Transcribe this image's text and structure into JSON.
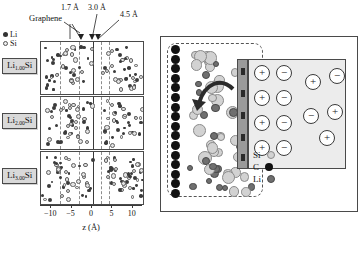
{
  "figure": {
    "left_panel": {
      "legend": [
        {
          "symbol": "li-filled-dot",
          "label": "Li"
        },
        {
          "symbol": "si-open-circle",
          "label": "Si"
        }
      ],
      "annotations": {
        "graphene": "Graphene",
        "dist_1": "1.7 Å",
        "dist_2": "3.0 Å",
        "dist_3": "4.5 Å"
      },
      "panels": [
        {
          "id": "a",
          "tag_prefix": "Li",
          "tag_sub": "1.00",
          "tag_suffix": "Si"
        },
        {
          "id": "b",
          "tag_prefix": "Li",
          "tag_sub": "2.00",
          "tag_suffix": "Si"
        },
        {
          "id": "c",
          "tag_prefix": "Li",
          "tag_sub": "3.00",
          "tag_suffix": "Si"
        }
      ],
      "axis": {
        "title": "z (Å)",
        "ticks": [
          "−10",
          "−5",
          "0",
          "5",
          "10"
        ],
        "range": [
          -12.5,
          12.5
        ]
      }
    },
    "right_panel": {
      "legend": [
        {
          "symbol": "si-sphere",
          "label": "Si",
          "color": "#d2d2d2"
        },
        {
          "symbol": "c-sphere",
          "label": "C",
          "color": "#111111"
        },
        {
          "symbol": "li-sphere",
          "label": "Li",
          "color": "#6f6f6f"
        }
      ],
      "electrolyte_ions": {
        "ordered_layer": [
          [
            "+",
            "−"
          ],
          [
            "+",
            "−"
          ],
          [
            "+",
            "−"
          ],
          [
            "+",
            "−"
          ]
        ],
        "bulk": [
          "+",
          "−",
          "−",
          "+",
          "+"
        ]
      },
      "arrow": "ion-transfer-arrow"
    }
  },
  "chart_data": {
    "type": "scatter",
    "xlabel": "z (Å)",
    "ylabel": "",
    "xlim": [
      -12.5,
      12.5
    ],
    "grid": false,
    "legend": [
      "Li",
      "Si"
    ],
    "legend_position": "top-left",
    "annotations": [
      {
        "text": "Graphene",
        "x": -1.0
      },
      {
        "text": "1.7 Å",
        "x": 0.9
      },
      {
        "text": "3.0 Å",
        "x": 2.2
      },
      {
        "text": "4.5 Å",
        "x": 4.5
      }
    ],
    "subplots": [
      {
        "label": "Li1.00Si",
        "series": [
          {
            "name": "Li",
            "color": "#3b3b3b"
          },
          {
            "name": "Si",
            "color": "#e2e2e2"
          }
        ]
      },
      {
        "label": "Li2.00Si",
        "series": [
          {
            "name": "Li",
            "color": "#3b3b3b"
          },
          {
            "name": "Si",
            "color": "#e2e2e2"
          }
        ]
      },
      {
        "label": "Li3.00Si",
        "series": [
          {
            "name": "Li",
            "color": "#3b3b3b"
          },
          {
            "name": "Si",
            "color": "#e2e2e2"
          }
        ]
      }
    ]
  }
}
